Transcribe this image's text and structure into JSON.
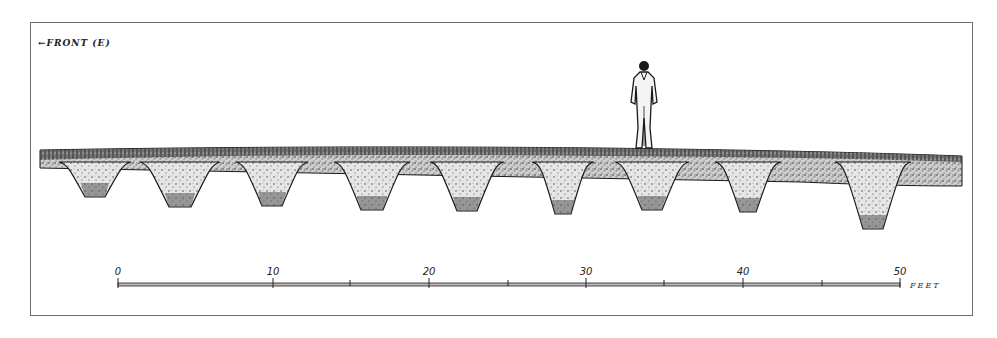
{
  "figure": {
    "orientation_label": "←FRONT (E)",
    "orientation_arrow": "left-arrow",
    "human_figure": "standing man for scale"
  },
  "scale_bar": {
    "unit": "FEET",
    "ticks": [
      {
        "value": "0",
        "x": 118
      },
      {
        "value": "10",
        "x": 273
      },
      {
        "value": "20",
        "x": 429
      },
      {
        "value": "30",
        "x": 586
      },
      {
        "value": "40",
        "x": 743
      },
      {
        "value": "50",
        "x": 900
      }
    ],
    "minor_ticks_x": [
      350,
      508,
      664,
      822
    ]
  },
  "pits": [
    {
      "id": 1,
      "cx": 95,
      "top_w": 56,
      "bot_w": 20,
      "bottom_y": 197
    },
    {
      "id": 2,
      "cx": 180,
      "top_w": 64,
      "bot_w": 22,
      "bottom_y": 207
    },
    {
      "id": 3,
      "cx": 272,
      "top_w": 56,
      "bot_w": 20,
      "bottom_y": 206
    },
    {
      "id": 4,
      "cx": 372,
      "top_w": 60,
      "bot_w": 22,
      "bottom_y": 210
    },
    {
      "id": 5,
      "cx": 467,
      "top_w": 58,
      "bot_w": 20,
      "bottom_y": 211
    },
    {
      "id": 6,
      "cx": 563,
      "top_w": 46,
      "bot_w": 16,
      "bottom_y": 214
    },
    {
      "id": 7,
      "cx": 652,
      "top_w": 58,
      "bot_w": 20,
      "bottom_y": 210
    },
    {
      "id": 8,
      "cx": 748,
      "top_w": 50,
      "bot_w": 16,
      "bottom_y": 212
    },
    {
      "id": 9,
      "cx": 873,
      "top_w": 60,
      "bot_w": 20,
      "bottom_y": 229
    }
  ],
  "colors": {
    "ink": "#1a1a1a",
    "frame": "#6f6f6f",
    "paper": "#ffffff",
    "stipple_light": "#bdbdbd",
    "stipple_dark": "#3a3a3a"
  }
}
